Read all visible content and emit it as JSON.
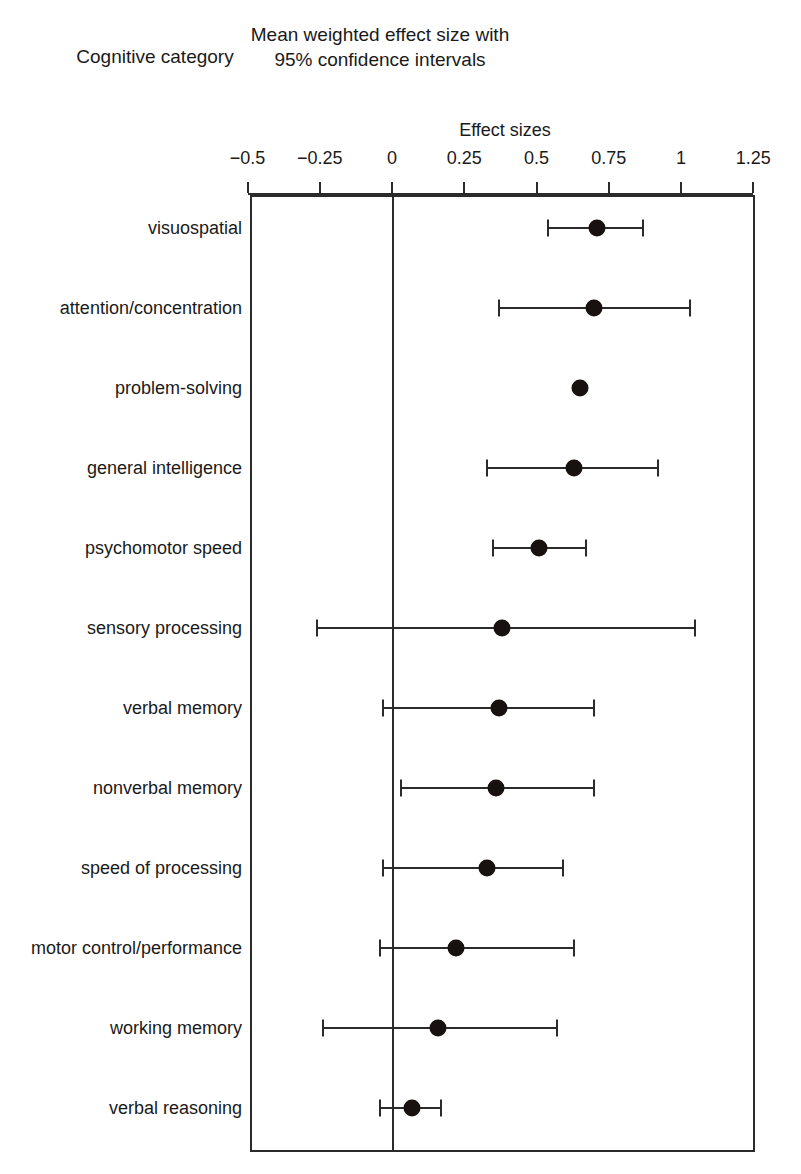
{
  "figure": {
    "category_column_header": "Cognitive\ncategory",
    "main_title": "Mean weighted effect size with 95% confidence intervals",
    "axis_title": "Effect sizes"
  },
  "chart_data": {
    "type": "scatter",
    "subtype": "forest-plot",
    "title": "Mean weighted effect size with 95% confidence intervals",
    "xlabel": "Effect sizes",
    "ylabel": "Cognitive category",
    "xlim": [
      -0.5,
      1.25
    ],
    "xticks": [
      -0.5,
      -0.25,
      0,
      0.25,
      0.5,
      0.75,
      1,
      1.25
    ],
    "xticklabels": [
      "−0.5",
      "−0.25",
      "0",
      "0.25",
      "0.5",
      "0.75",
      "1",
      "1.25"
    ],
    "grid": false,
    "legend": null,
    "reference_line": 0,
    "categories": [
      "visuospatial",
      "attention/concentration",
      "problem-solving",
      "general intelligence",
      "psychomotor speed",
      "sensory processing",
      "verbal memory",
      "nonverbal memory",
      "speed of processing",
      "motor control/\nperformance",
      "working memory",
      "verbal reasoning"
    ],
    "points": [
      {
        "category": "visuospatial",
        "effect_size": 0.71,
        "ci_low": 0.54,
        "ci_high": 0.87
      },
      {
        "category": "attention/concentration",
        "effect_size": 0.7,
        "ci_low": 0.37,
        "ci_high": 1.03
      },
      {
        "category": "problem-solving",
        "effect_size": 0.65,
        "ci_low": null,
        "ci_high": null
      },
      {
        "category": "general intelligence",
        "effect_size": 0.63,
        "ci_low": 0.33,
        "ci_high": 0.92
      },
      {
        "category": "psychomotor speed",
        "effect_size": 0.51,
        "ci_low": 0.35,
        "ci_high": 0.67
      },
      {
        "category": "sensory processing",
        "effect_size": 0.38,
        "ci_low": -0.26,
        "ci_high": 1.05
      },
      {
        "category": "verbal memory",
        "effect_size": 0.37,
        "ci_low": -0.03,
        "ci_high": 0.7
      },
      {
        "category": "nonverbal memory",
        "effect_size": 0.36,
        "ci_low": 0.03,
        "ci_high": 0.7
      },
      {
        "category": "speed of processing",
        "effect_size": 0.33,
        "ci_low": -0.03,
        "ci_high": 0.59
      },
      {
        "category": "motor control/performance",
        "effect_size": 0.22,
        "ci_low": -0.04,
        "ci_high": 0.63
      },
      {
        "category": "working memory",
        "effect_size": 0.16,
        "ci_low": -0.24,
        "ci_high": 0.57
      },
      {
        "category": "verbal reasoning",
        "effect_size": 0.07,
        "ci_low": -0.04,
        "ci_high": 0.17
      }
    ]
  },
  "style": {
    "line_color": "#2b2b2b",
    "marker_color": "#17110f",
    "background": "#ffffff"
  }
}
